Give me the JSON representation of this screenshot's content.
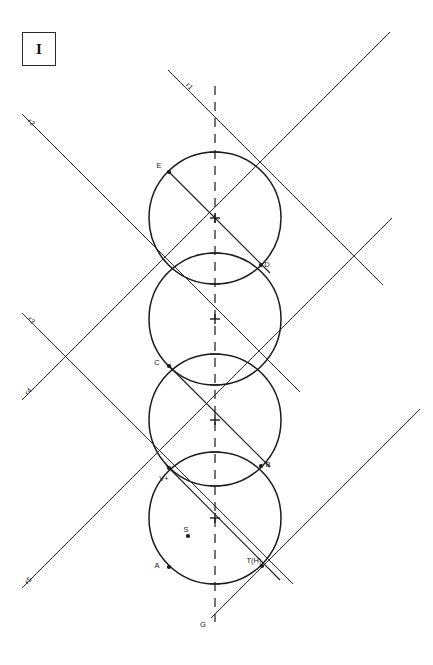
{
  "figure": {
    "plate_label": "I",
    "background_color": "#ffffff",
    "stroke_color": "#1a1a1a",
    "canvas": {
      "width": 433,
      "height": 665
    },
    "axis": {
      "name": "vertical-dashed-axis",
      "x": 215,
      "y_top": 86,
      "y_bottom": 622,
      "style": "dashed",
      "bottom_label": "G"
    },
    "circles": [
      {
        "id": "circle-1",
        "cx": 215,
        "cy": 218,
        "r": 66
      },
      {
        "id": "circle-2",
        "cx": 215,
        "cy": 319,
        "r": 66
      },
      {
        "id": "circle-3",
        "cx": 215,
        "cy": 420,
        "r": 66
      },
      {
        "id": "circle-4",
        "cx": 215,
        "cy": 518,
        "r": 66
      }
    ],
    "center_marks": [
      {
        "id": "center-mark-1",
        "x": 215,
        "y": 218
      },
      {
        "id": "center-mark-2",
        "x": 215,
        "y": 319
      },
      {
        "id": "center-mark-3",
        "x": 215,
        "y": 420
      },
      {
        "id": "center-mark-4",
        "x": 215,
        "y": 518
      }
    ],
    "axis_ticks": [
      {
        "id": "tick-top-1",
        "x": 215,
        "y": 152
      },
      {
        "id": "tick-top-2",
        "x": 215,
        "y": 253
      },
      {
        "id": "tick-top-3",
        "x": 215,
        "y": 354
      },
      {
        "id": "tick-top-4",
        "x": 215,
        "y": 452
      },
      {
        "id": "tick-bot-1",
        "x": 215,
        "y": 284
      },
      {
        "id": "tick-bot-2",
        "x": 215,
        "y": 385
      },
      {
        "id": "tick-bot-3",
        "x": 215,
        "y": 486
      },
      {
        "id": "tick-bot-4",
        "x": 215,
        "y": 584
      }
    ],
    "rays": [
      {
        "id": "ray-r1",
        "label": "r1",
        "x1": 168,
        "y1": 70,
        "x2": 383,
        "y2": 285,
        "label_x": 188,
        "label_y": 88,
        "label_rot": 45
      },
      {
        "id": "ray-r2",
        "label": "r2",
        "x1": 22,
        "y1": 114,
        "x2": 300,
        "y2": 392,
        "label_x": 30,
        "label_y": 124,
        "label_rot": 45
      },
      {
        "id": "ray-r3",
        "label": "r3",
        "x1": 22,
        "y1": 313,
        "x2": 293,
        "y2": 584,
        "label_x": 30,
        "label_y": 322,
        "label_rot": 45
      },
      {
        "id": "ray-r4",
        "label": "r4",
        "x1": 22,
        "y1": 400,
        "x2": 390,
        "y2": 32,
        "label_x": 30,
        "label_y": 393,
        "label_rot": -45
      },
      {
        "id": "ray-r5",
        "label": "r5",
        "x1": 22,
        "y1": 588,
        "x2": 392,
        "y2": 218,
        "label_x": 30,
        "label_y": 582,
        "label_rot": -45
      },
      {
        "id": "ray-diag-right-down",
        "label": "",
        "x1": 211,
        "y1": 618,
        "x2": 420,
        "y2": 409,
        "label_x": 0,
        "label_y": 0,
        "label_rot": 0
      }
    ],
    "points": [
      {
        "id": "point-E",
        "label": "E",
        "x": 169,
        "y": 172,
        "label_dx": -10,
        "label_dy": -4
      },
      {
        "id": "point-D",
        "label": "D",
        "x": 261,
        "y": 265,
        "label_dx": 6,
        "label_dy": 2
      },
      {
        "id": "point-C",
        "label": "C",
        "x": 169,
        "y": 366,
        "label_dx": -12,
        "label_dy": -1
      },
      {
        "id": "point-B",
        "label": "B",
        "x": 261,
        "y": 466,
        "label_dx": 7,
        "label_dy": 1
      },
      {
        "id": "point-V",
        "label": "V+",
        "x": 169,
        "y": 468,
        "label_dx": -5,
        "label_dy": 13
      },
      {
        "id": "point-A",
        "label": "A",
        "x": 169,
        "y": 567,
        "label_dx": -12,
        "label_dy": 1
      },
      {
        "id": "point-T",
        "label": "T(H)",
        "x": 262,
        "y": 566,
        "label_dx": -8,
        "label_dy": -3
      },
      {
        "id": "point-S",
        "label": "S",
        "x": 188,
        "y": 536,
        "label_dx": -2,
        "label_dy": -4
      }
    ],
    "chords": [
      {
        "id": "chord-E-D",
        "x1": 169,
        "y1": 172,
        "x2": 270,
        "y2": 273
      },
      {
        "id": "chord-C-B",
        "x1": 169,
        "y1": 366,
        "x2": 270,
        "y2": 467
      },
      {
        "id": "chord-V-T",
        "x1": 166,
        "y1": 465,
        "x2": 280,
        "y2": 580
      }
    ]
  }
}
